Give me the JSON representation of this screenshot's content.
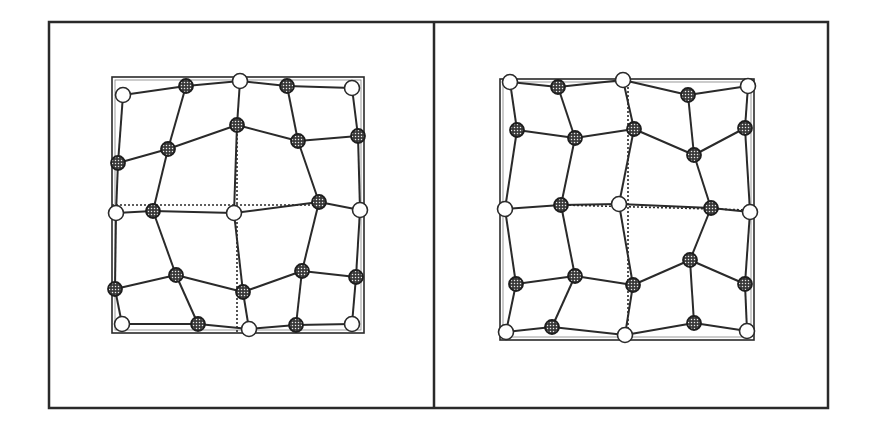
{
  "figure": {
    "width": 874,
    "height": 434,
    "background": "#ffffff",
    "ink_color": "#2a2a2a",
    "outer_frame": {
      "x": 49,
      "y": 22,
      "width": 779,
      "height": 386
    },
    "divider": {
      "x": 434,
      "y1": 22,
      "y2": 408
    },
    "node_radius": 7.5,
    "node_styles": {
      "open": {
        "fill": "#ffffff",
        "stroke": "#2a2a2a"
      },
      "shaded": {
        "fill": "#4a4a4a",
        "stroke": "#1e1e1e",
        "pattern": "dotted-stipple"
      }
    }
  },
  "panels": [
    {
      "id": "left",
      "inner_square": {
        "x": 112,
        "y": 77,
        "width": 252,
        "height": 256
      },
      "reference_lines": [
        {
          "type": "dotted",
          "x1": 237,
          "y1": 130,
          "x2": 237,
          "y2": 333
        },
        {
          "type": "dotted",
          "x1": 112,
          "y1": 205,
          "x2": 319,
          "y2": 205
        }
      ],
      "nodes": [
        {
          "id": "a1",
          "x": 123,
          "y": 95,
          "kind": "open"
        },
        {
          "id": "a2",
          "x": 186,
          "y": 86,
          "kind": "shaded"
        },
        {
          "id": "a3",
          "x": 240,
          "y": 81,
          "kind": "open"
        },
        {
          "id": "a4",
          "x": 287,
          "y": 86,
          "kind": "shaded"
        },
        {
          "id": "a5",
          "x": 352,
          "y": 88,
          "kind": "open"
        },
        {
          "id": "b1",
          "x": 118,
          "y": 163,
          "kind": "shaded"
        },
        {
          "id": "b2",
          "x": 168,
          "y": 149,
          "kind": "shaded"
        },
        {
          "id": "b3",
          "x": 237,
          "y": 125,
          "kind": "shaded"
        },
        {
          "id": "b4",
          "x": 298,
          "y": 141,
          "kind": "shaded"
        },
        {
          "id": "b5",
          "x": 358,
          "y": 136,
          "kind": "shaded"
        },
        {
          "id": "c1",
          "x": 116,
          "y": 213,
          "kind": "open"
        },
        {
          "id": "c2",
          "x": 153,
          "y": 211,
          "kind": "shaded"
        },
        {
          "id": "c3",
          "x": 234,
          "y": 213,
          "kind": "open"
        },
        {
          "id": "c4",
          "x": 319,
          "y": 202,
          "kind": "shaded"
        },
        {
          "id": "c5",
          "x": 360,
          "y": 210,
          "kind": "open"
        },
        {
          "id": "d1",
          "x": 115,
          "y": 289,
          "kind": "shaded"
        },
        {
          "id": "d2",
          "x": 176,
          "y": 275,
          "kind": "shaded"
        },
        {
          "id": "d3",
          "x": 243,
          "y": 292,
          "kind": "shaded"
        },
        {
          "id": "d4",
          "x": 302,
          "y": 271,
          "kind": "shaded"
        },
        {
          "id": "d5",
          "x": 356,
          "y": 277,
          "kind": "shaded"
        },
        {
          "id": "e1",
          "x": 122,
          "y": 324,
          "kind": "open"
        },
        {
          "id": "e2",
          "x": 198,
          "y": 324,
          "kind": "shaded"
        },
        {
          "id": "e3",
          "x": 249,
          "y": 329,
          "kind": "open"
        },
        {
          "id": "e4",
          "x": 296,
          "y": 325,
          "kind": "shaded"
        },
        {
          "id": "e5",
          "x": 352,
          "y": 324,
          "kind": "open"
        }
      ],
      "edges": [
        [
          "a1",
          "a2"
        ],
        [
          "a2",
          "a3"
        ],
        [
          "a3",
          "a4"
        ],
        [
          "a4",
          "a5"
        ],
        [
          "b1",
          "b2"
        ],
        [
          "b2",
          "b3"
        ],
        [
          "b3",
          "b4"
        ],
        [
          "b4",
          "b5"
        ],
        [
          "c1",
          "c2"
        ],
        [
          "c2",
          "c3"
        ],
        [
          "c3",
          "c4"
        ],
        [
          "c4",
          "c5"
        ],
        [
          "d1",
          "d2"
        ],
        [
          "d2",
          "d3"
        ],
        [
          "d3",
          "d4"
        ],
        [
          "d4",
          "d5"
        ],
        [
          "e1",
          "e2"
        ],
        [
          "e2",
          "e3"
        ],
        [
          "e3",
          "e4"
        ],
        [
          "e4",
          "e5"
        ],
        [
          "a1",
          "b1"
        ],
        [
          "b1",
          "c1"
        ],
        [
          "c1",
          "d1"
        ],
        [
          "d1",
          "e1"
        ],
        [
          "a2",
          "b2"
        ],
        [
          "b2",
          "c2"
        ],
        [
          "c2",
          "d2"
        ],
        [
          "d2",
          "e2"
        ],
        [
          "a3",
          "b3"
        ],
        [
          "b3",
          "c3"
        ],
        [
          "c3",
          "d3"
        ],
        [
          "d3",
          "e3"
        ],
        [
          "a4",
          "b4"
        ],
        [
          "b4",
          "c4"
        ],
        [
          "c4",
          "d4"
        ],
        [
          "d4",
          "e4"
        ],
        [
          "a5",
          "b5"
        ],
        [
          "b5",
          "c5"
        ],
        [
          "c5",
          "d5"
        ],
        [
          "d5",
          "e5"
        ]
      ]
    },
    {
      "id": "right",
      "inner_square": {
        "x": 500,
        "y": 79,
        "width": 254,
        "height": 261
      },
      "reference_lines": [
        {
          "type": "dotted",
          "x1": 628,
          "y1": 79,
          "x2": 628,
          "y2": 340
        },
        {
          "type": "dotted",
          "x1": 561,
          "y1": 205,
          "x2": 750,
          "y2": 210
        }
      ],
      "nodes": [
        {
          "id": "a1",
          "x": 510,
          "y": 82,
          "kind": "open"
        },
        {
          "id": "a2",
          "x": 558,
          "y": 87,
          "kind": "shaded"
        },
        {
          "id": "a3",
          "x": 623,
          "y": 80,
          "kind": "open"
        },
        {
          "id": "a4",
          "x": 688,
          "y": 95,
          "kind": "shaded"
        },
        {
          "id": "a5",
          "x": 748,
          "y": 86,
          "kind": "open"
        },
        {
          "id": "b1",
          "x": 517,
          "y": 130,
          "kind": "shaded"
        },
        {
          "id": "b2",
          "x": 575,
          "y": 138,
          "kind": "shaded"
        },
        {
          "id": "b3",
          "x": 634,
          "y": 129,
          "kind": "shaded"
        },
        {
          "id": "b4",
          "x": 694,
          "y": 155,
          "kind": "shaded"
        },
        {
          "id": "b5",
          "x": 745,
          "y": 128,
          "kind": "shaded"
        },
        {
          "id": "c1",
          "x": 505,
          "y": 209,
          "kind": "open"
        },
        {
          "id": "c2",
          "x": 561,
          "y": 205,
          "kind": "shaded"
        },
        {
          "id": "c3",
          "x": 619,
          "y": 204,
          "kind": "open"
        },
        {
          "id": "c4",
          "x": 711,
          "y": 208,
          "kind": "shaded"
        },
        {
          "id": "c5",
          "x": 750,
          "y": 212,
          "kind": "open"
        },
        {
          "id": "d1",
          "x": 516,
          "y": 284,
          "kind": "shaded"
        },
        {
          "id": "d2",
          "x": 575,
          "y": 276,
          "kind": "shaded"
        },
        {
          "id": "d3",
          "x": 633,
          "y": 285,
          "kind": "shaded"
        },
        {
          "id": "d4",
          "x": 690,
          "y": 260,
          "kind": "shaded"
        },
        {
          "id": "d5",
          "x": 745,
          "y": 284,
          "kind": "shaded"
        },
        {
          "id": "e1",
          "x": 506,
          "y": 332,
          "kind": "open"
        },
        {
          "id": "e2",
          "x": 552,
          "y": 327,
          "kind": "shaded"
        },
        {
          "id": "e3",
          "x": 625,
          "y": 335,
          "kind": "open"
        },
        {
          "id": "e4",
          "x": 694,
          "y": 323,
          "kind": "shaded"
        },
        {
          "id": "e5",
          "x": 747,
          "y": 331,
          "kind": "open"
        }
      ],
      "edges": [
        [
          "a1",
          "a2"
        ],
        [
          "a2",
          "a3"
        ],
        [
          "a3",
          "a4"
        ],
        [
          "a4",
          "a5"
        ],
        [
          "b1",
          "b2"
        ],
        [
          "b2",
          "b3"
        ],
        [
          "b3",
          "b4"
        ],
        [
          "b4",
          "b5"
        ],
        [
          "c1",
          "c2"
        ],
        [
          "c2",
          "c3"
        ],
        [
          "c3",
          "c4"
        ],
        [
          "c4",
          "c5"
        ],
        [
          "d1",
          "d2"
        ],
        [
          "d2",
          "d3"
        ],
        [
          "d3",
          "d4"
        ],
        [
          "d4",
          "d5"
        ],
        [
          "e1",
          "e2"
        ],
        [
          "e2",
          "e3"
        ],
        [
          "e3",
          "e4"
        ],
        [
          "e4",
          "e5"
        ],
        [
          "a1",
          "b1"
        ],
        [
          "b1",
          "c1"
        ],
        [
          "c1",
          "d1"
        ],
        [
          "d1",
          "e1"
        ],
        [
          "a2",
          "b2"
        ],
        [
          "b2",
          "c2"
        ],
        [
          "c2",
          "d2"
        ],
        [
          "d2",
          "e2"
        ],
        [
          "a3",
          "b3"
        ],
        [
          "b3",
          "c3"
        ],
        [
          "c3",
          "d3"
        ],
        [
          "d3",
          "e3"
        ],
        [
          "a4",
          "b4"
        ],
        [
          "b4",
          "c4"
        ],
        [
          "c4",
          "d4"
        ],
        [
          "d4",
          "e4"
        ],
        [
          "a5",
          "b5"
        ],
        [
          "b5",
          "c5"
        ],
        [
          "c5",
          "d5"
        ],
        [
          "d5",
          "e5"
        ]
      ]
    }
  ]
}
